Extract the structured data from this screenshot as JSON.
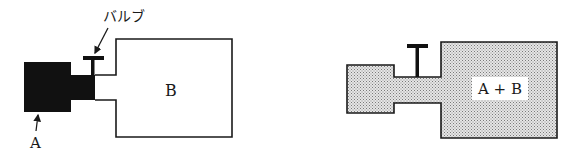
{
  "diagram": {
    "type": "gas-mixing-vessels",
    "colors": {
      "ink": "#1a1a1a",
      "gas_a": "#111111",
      "mixed": "#c8c8c8",
      "background": "#ffffff"
    },
    "before": {
      "valve_label": "バルブ",
      "container_a_label": "A",
      "container_b_label": "B",
      "valve_state": "closed"
    },
    "after": {
      "mixed_label": "A + B",
      "valve_state": "open"
    }
  }
}
